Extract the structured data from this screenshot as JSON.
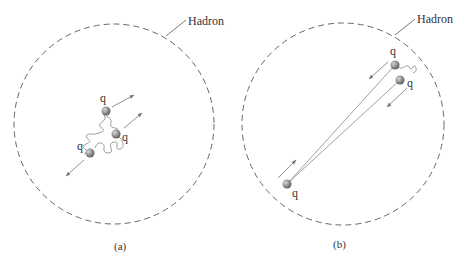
{
  "panels": [
    {
      "caption": "(a)",
      "boundary_label": "Hadron",
      "quarks": [
        {
          "label": "q"
        },
        {
          "label": "q"
        },
        {
          "label": "q"
        }
      ],
      "description": "Quarks close together, bound by gluon field, moving apart"
    },
    {
      "caption": "(b)",
      "boundary_label": "Hadron",
      "quarks": [
        {
          "label": "q"
        },
        {
          "label": "q"
        },
        {
          "label": "q"
        }
      ],
      "description": "Quarks separated, connected by stretched color flux lines"
    }
  ],
  "colors": {
    "boundary": "#555555",
    "quark": "#8a8a8a",
    "line": "#888888",
    "text": "#333333"
  }
}
